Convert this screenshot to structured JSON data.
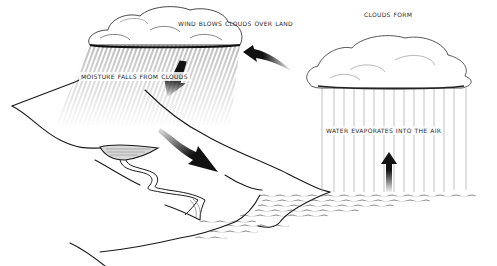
{
  "diagram": {
    "labels": {
      "wind": "Wind blows clouds over land",
      "clouds_form": "Clouds form",
      "moisture": "Moisture falls from clouds",
      "evaporates": "Water evaporates into the air"
    },
    "parts": [
      "rain-cloud",
      "forming-cloud",
      "rain",
      "hills",
      "lake",
      "river",
      "sea",
      "evaporation",
      "wind-arrow",
      "rain-arrow",
      "runoff-arrow",
      "evaporation-arrow"
    ],
    "colors": {
      "ink": "#1a1a1a",
      "text": "#2a2a2a",
      "background": "#ffffff"
    }
  }
}
